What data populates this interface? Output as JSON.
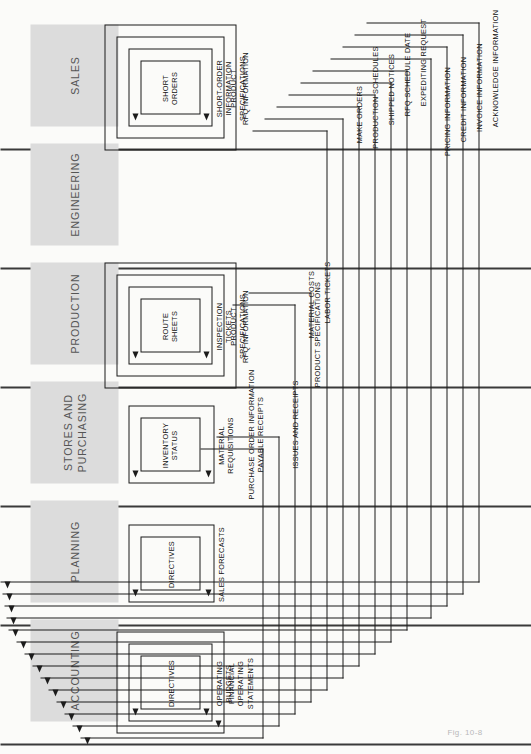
{
  "figure": {
    "caption": "Fig. 10-8",
    "orientation": "rotated-90-ccw"
  },
  "departments": [
    {
      "id": "sales",
      "label": "SALES"
    },
    {
      "id": "engineering",
      "label": "ENGINEERING"
    },
    {
      "id": "production",
      "label": "PRODUCTION"
    },
    {
      "id": "stores",
      "label": "STORES AND\nPURCHASING"
    },
    {
      "id": "planning",
      "label": "PLANNING"
    },
    {
      "id": "accounting",
      "label": "ACCOUNTING"
    }
  ],
  "document_boxes": [
    {
      "id": "short-orders",
      "label": "SHORT\nORDERS"
    },
    {
      "id": "short-order-info",
      "label": "SHORT-ORDER\nINFORMATION"
    },
    {
      "id": "product-specs-eng",
      "label": "PRODUCT\nSPECIFICATIONS"
    },
    {
      "id": "rfq-information-eng",
      "label": "RFQ INFORMATION"
    },
    {
      "id": "route-sheets",
      "label": "ROUTE\nSHEETS"
    },
    {
      "id": "inspection-tickets",
      "label": "INSPECTION\nTICKETS"
    },
    {
      "id": "product-specs-prod",
      "label": "PRODUCT\nSPECIFICATIONS"
    },
    {
      "id": "rfq-information-prod",
      "label": "RFQ INFORMATION"
    },
    {
      "id": "inventory-status",
      "label": "INVENTORY\nSTATUS"
    },
    {
      "id": "material-requisitions",
      "label": "MATERIAL\nREQUISITIONS"
    },
    {
      "id": "directives-planning",
      "label": "DIRECTIVES"
    },
    {
      "id": "sales-forecasts",
      "label": "SALES FORECASTS"
    },
    {
      "id": "directives-accounting",
      "label": "DIRECTIVES"
    },
    {
      "id": "operating-budgets",
      "label": "OPERATING\nBUDGETS"
    },
    {
      "id": "financial-statements",
      "label": "FINANCIAL\nOPERATING\nSTATEMENTS"
    }
  ],
  "flow_labels": [
    {
      "id": "purchase-order-info",
      "label": "PURCHASE ORDER INFORMATION\nPAYABLE RECEIPTS"
    },
    {
      "id": "issues-and-receipts",
      "label": "ISSUES AND RECEIPTS"
    },
    {
      "id": "material-costs",
      "label": "MATERIAL COSTS"
    },
    {
      "id": "labor-tickets",
      "label": "LABOR TICKETS"
    },
    {
      "id": "product-specifications",
      "label": "PRODUCT SPECIFICATIONS"
    },
    {
      "id": "make-orders",
      "label": "MAKE ORDERS"
    },
    {
      "id": "production-schedules",
      "label": "PRODUCTION SCHEDULES"
    },
    {
      "id": "shipped-notices",
      "label": "SHIPPED NOTICES"
    },
    {
      "id": "rfq-schedule-date",
      "label": "RFQ SCHEDULE DATE"
    },
    {
      "id": "expediting-request",
      "label": "EXPEDITING REQUEST"
    },
    {
      "id": "pricing-information",
      "label": "PRICING INFORMATION"
    },
    {
      "id": "credit-information",
      "label": "CREDIT INFORMATION"
    },
    {
      "id": "invoice-information",
      "label": "INVOICE INFORMATION"
    },
    {
      "id": "acknowledge-information",
      "label": "ACKNOWLEDGE INFORMATION"
    }
  ],
  "colors": {
    "department_fill": "#dcdcdc",
    "line": "#1b1b1b",
    "rule": "#3a3a3a",
    "department_text": "#555555"
  }
}
